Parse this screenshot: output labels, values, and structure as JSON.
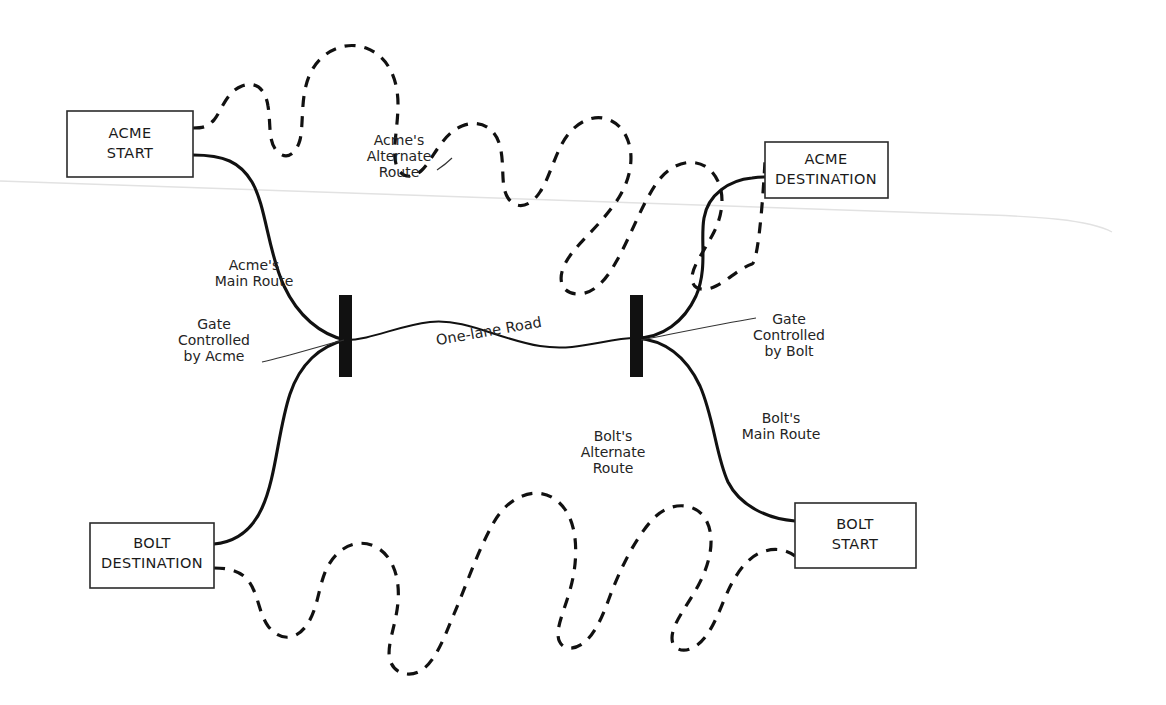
{
  "diagram": {
    "background_color": "#ffffff",
    "line_color": "#111111",
    "gate_color": "#111111"
  },
  "nodes": [
    {
      "id": "acme-start",
      "line1": "ACME",
      "line2": "START",
      "x": 67,
      "y": 111,
      "w": 126,
      "h": 66
    },
    {
      "id": "acme-destination",
      "line1": "ACME",
      "line2": "DESTINATION",
      "x": 765,
      "y": 142,
      "w": 123,
      "h": 56
    },
    {
      "id": "bolt-destination",
      "line1": "BOLT",
      "line2": "DESTINATION",
      "x": 90,
      "y": 523,
      "w": 124,
      "h": 65
    },
    {
      "id": "bolt-start",
      "line1": "BOLT",
      "line2": "START",
      "x": 795,
      "y": 503,
      "w": 121,
      "h": 65
    }
  ],
  "gates": [
    {
      "id": "gate-acme",
      "label_line1": "Gate",
      "label_line2": "Controlled",
      "label_line3": "by Acme",
      "x": 339,
      "y": 295,
      "w": 13,
      "h": 82
    },
    {
      "id": "gate-bolt",
      "label_line1": "Gate",
      "label_line2": "Controlled",
      "label_line3": "by Bolt",
      "x": 630,
      "y": 295,
      "w": 13,
      "h": 82
    }
  ],
  "route_labels": {
    "acme_main": {
      "line1": "Acme's",
      "line2": "Main Route"
    },
    "acme_alternate": {
      "line1": "Acme's",
      "line2": "Alternate",
      "line3": "Route"
    },
    "bolt_main": {
      "line1": "Bolt's",
      "line2": "Main Route"
    },
    "bolt_alternate": {
      "line1": "Bolt's",
      "line2": "Alternate",
      "line3": "Route"
    },
    "one_lane_road": {
      "text": "One-lane Road"
    }
  },
  "routes": [
    {
      "id": "acme-main-route",
      "style": "solid",
      "from": "acme-start",
      "to": "gate-acme"
    },
    {
      "id": "acme-main-route-east",
      "style": "solid",
      "from": "gate-bolt",
      "to": "acme-destination"
    },
    {
      "id": "acme-alternate-route",
      "style": "dashed",
      "from": "acme-start",
      "to": "acme-destination"
    },
    {
      "id": "bolt-main-route",
      "style": "solid",
      "from": "bolt-start",
      "to": "gate-bolt"
    },
    {
      "id": "bolt-main-route-west",
      "style": "solid",
      "from": "gate-acme",
      "to": "bolt-destination"
    },
    {
      "id": "bolt-alternate-route",
      "style": "dashed",
      "from": "bolt-start",
      "to": "bolt-destination"
    },
    {
      "id": "one-lane-road",
      "style": "solid",
      "from": "gate-acme",
      "to": "gate-bolt"
    }
  ]
}
